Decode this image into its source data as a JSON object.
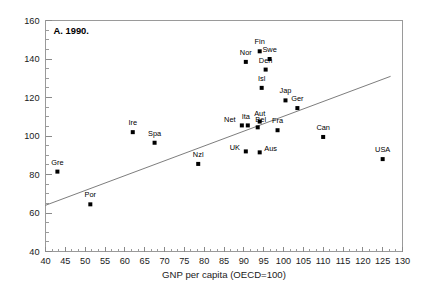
{
  "chart_data": {
    "type": "scatter",
    "title": "A. 1990.",
    "xlabel": "GNP per capita (OECD=100)",
    "ylabel": "",
    "xlim": [
      40,
      130
    ],
    "ylim": [
      40,
      160
    ],
    "xticks": [
      40,
      45,
      50,
      55,
      60,
      65,
      70,
      75,
      80,
      85,
      90,
      95,
      100,
      105,
      110,
      115,
      120,
      125,
      130
    ],
    "yticks": [
      40,
      60,
      80,
      100,
      120,
      140,
      160
    ],
    "x_minor_step": 1.6667,
    "y_minor_step": 5,
    "grid": false,
    "legend": "none",
    "points": [
      {
        "label": "Gre",
        "x": 43.0,
        "y": 81.5,
        "label_dx": 0,
        "label_dy": -7
      },
      {
        "label": "Por",
        "x": 51.3,
        "y": 64.5,
        "label_dx": 0,
        "label_dy": -7
      },
      {
        "label": "Ire",
        "x": 62.0,
        "y": 102.0,
        "label_dx": 0,
        "label_dy": -7
      },
      {
        "label": "Spa",
        "x": 67.5,
        "y": 96.5,
        "label_dx": 0,
        "label_dy": -7
      },
      {
        "label": "Nzl",
        "x": 78.5,
        "y": 85.5,
        "label_dx": 0,
        "label_dy": -7
      },
      {
        "label": "Net",
        "x": 89.5,
        "y": 105.5,
        "label_dx": -12,
        "label_dy": -3
      },
      {
        "label": "UK",
        "x": 90.5,
        "y": 92.0,
        "label_dx": -11,
        "label_dy": -1
      },
      {
        "label": "Ita",
        "x": 91.0,
        "y": 105.5,
        "label_dx": -2,
        "label_dy": -6
      },
      {
        "label": "Bel",
        "x": 93.5,
        "y": 104.5,
        "label_dx": 3,
        "label_dy": -5
      },
      {
        "label": "Aut",
        "x": 94.0,
        "y": 107.5,
        "label_dx": 0,
        "label_dy": -6
      },
      {
        "label": "Aus",
        "x": 94.0,
        "y": 91.5,
        "label_dx": 11,
        "label_dy": -1
      },
      {
        "label": "Nor",
        "x": 90.5,
        "y": 138.5,
        "label_dx": 0,
        "label_dy": -7
      },
      {
        "label": "Fin",
        "x": 94.0,
        "y": 144.0,
        "label_dx": 0,
        "label_dy": -7
      },
      {
        "label": "Swe",
        "x": 96.5,
        "y": 140.0,
        "label_dx": 0,
        "label_dy": -7
      },
      {
        "label": "Den",
        "x": 95.5,
        "y": 134.5,
        "label_dx": 0,
        "label_dy": -7
      },
      {
        "label": "Isl",
        "x": 94.5,
        "y": 125.0,
        "label_dx": 0,
        "label_dy": -7
      },
      {
        "label": "Fra",
        "x": 98.5,
        "y": 103.0,
        "label_dx": 0,
        "label_dy": -7
      },
      {
        "label": "Jap",
        "x": 100.5,
        "y": 118.5,
        "label_dx": 0,
        "label_dy": -7
      },
      {
        "label": "Ger",
        "x": 103.5,
        "y": 114.5,
        "label_dx": 0,
        "label_dy": -7
      },
      {
        "label": "Can",
        "x": 110.0,
        "y": 99.5,
        "label_dx": 0,
        "label_dy": -7
      },
      {
        "label": "USA",
        "x": 125.0,
        "y": 88.0,
        "label_dx": 0,
        "label_dy": -7
      }
    ],
    "trend_line": {
      "x1": 40.0,
      "y1": 64.0,
      "x2": 127.0,
      "y2": 131.0
    }
  }
}
